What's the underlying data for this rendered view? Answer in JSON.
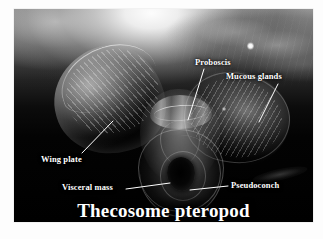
{
  "figure": {
    "caption": "Thecosome pteropod"
  },
  "annotations": [
    {
      "id": "proboscis",
      "label": "Proboscis",
      "leader": {
        "x1": 190,
        "y1": 60,
        "x2": 174,
        "y2": 111
      }
    },
    {
      "id": "mucous-glands",
      "label": "Mucous glands",
      "leader": {
        "x1": 264,
        "y1": 75,
        "x2": 245,
        "y2": 113
      }
    },
    {
      "id": "wing-plate",
      "label": "Wing plate",
      "leader": {
        "x1": 68,
        "y1": 144,
        "x2": 99,
        "y2": 112
      }
    },
    {
      "id": "visceral-mass",
      "label": "Visceral mass",
      "leader": {
        "x1": 112,
        "y1": 180,
        "x2": 156,
        "y2": 174
      }
    },
    {
      "id": "pseudoconch",
      "label": "Pseudoconch",
      "leader": {
        "x1": 214,
        "y1": 177,
        "x2": 176,
        "y2": 181
      }
    }
  ],
  "colors": {
    "label_text": "#ffffff",
    "leader_line": "#ffffff",
    "photo_background": "#000000",
    "page_background": "#ffffff"
  }
}
